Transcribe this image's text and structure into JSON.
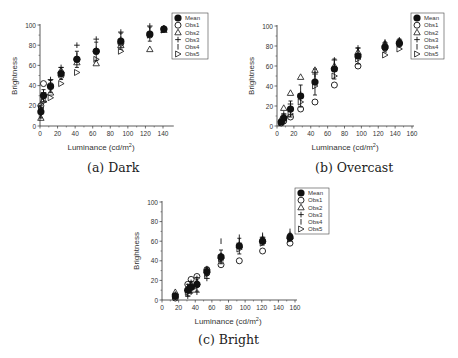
{
  "chart_data": [
    {
      "id": "dark",
      "type": "scatter",
      "caption": "(a) Dark",
      "title": "",
      "xlabel": "Luminance (cd/m²)",
      "ylabel": "Brightness",
      "xlim": [
        0,
        150
      ],
      "ylim": [
        0,
        100
      ],
      "xticks": [
        0,
        20,
        40,
        60,
        80,
        100,
        120,
        140
      ],
      "yticks": [
        0,
        20,
        40,
        60,
        80,
        100
      ],
      "grid": false,
      "legend_position": "upper right (outside)",
      "legend": [
        "Mean",
        "Obs1",
        "Obs2",
        "Obs3",
        "Obs4",
        "Obs5"
      ],
      "x": [
        1,
        4,
        12,
        24,
        42,
        64,
        92,
        125,
        141
      ],
      "series": [
        {
          "name": "Mean",
          "marker": "filled-circle",
          "values": [
            14,
            30,
            39,
            52,
            66,
            74,
            84,
            91,
            96
          ],
          "err": [
            6,
            6,
            6,
            6,
            8,
            9,
            8,
            7,
            2
          ]
        },
        {
          "name": "Obs1",
          "marker": "open-circle",
          "values": [
            20,
            42,
            40,
            50,
            66,
            74,
            82,
            90,
            96
          ]
        },
        {
          "name": "Obs2",
          "marker": "open-triangle",
          "values": [
            8,
            26,
            33,
            55,
            63,
            62,
            80,
            76,
            95
          ]
        },
        {
          "name": "Obs3",
          "marker": "plus",
          "values": [
            18,
            33,
            46,
            58,
            80,
            86,
            93,
            99,
            97
          ]
        },
        {
          "name": "Obs4",
          "marker": "vbar",
          "values": [
            10,
            28,
            44,
            53,
            70,
            76,
            86,
            95,
            97
          ]
        },
        {
          "name": "Obs5",
          "marker": "right-triangle",
          "values": [
            17,
            24,
            28,
            42,
            53,
            66,
            74,
            90,
            95
          ]
        }
      ]
    },
    {
      "id": "overcast",
      "type": "scatter",
      "caption": "(b) Overcast",
      "title": "",
      "xlabel": "Luminance (cd/m²)",
      "ylabel": "Brightness",
      "xlim": [
        0,
        160
      ],
      "ylim": [
        0,
        100
      ],
      "xticks": [
        0,
        20,
        40,
        60,
        80,
        100,
        120,
        140,
        160
      ],
      "yticks": [
        0,
        20,
        40,
        60,
        80,
        100
      ],
      "grid": false,
      "legend_position": "upper right (outside)",
      "legend": [
        "Mean",
        "Obs1",
        "Obs2",
        "Obs3",
        "Obs4",
        "Obs5"
      ],
      "x": [
        5,
        8,
        16,
        28,
        45,
        68,
        96,
        128,
        145
      ],
      "series": [
        {
          "name": "Mean",
          "marker": "filled-circle",
          "values": [
            4,
            8,
            17,
            30,
            44,
            57,
            70,
            79,
            83
          ],
          "err": [
            2,
            4,
            8,
            11,
            13,
            10,
            8,
            5,
            4
          ]
        },
        {
          "name": "Obs1",
          "marker": "open-circle",
          "values": [
            3,
            5,
            9,
            17,
            24,
            41,
            60,
            78,
            82
          ]
        },
        {
          "name": "Obs2",
          "marker": "open-triangle",
          "values": [
            7,
            18,
            33,
            49,
            56,
            60,
            74,
            82,
            85
          ]
        },
        {
          "name": "Obs3",
          "marker": "plus",
          "values": [
            5,
            12,
            22,
            32,
            52,
            66,
            78,
            83,
            86
          ]
        },
        {
          "name": "Obs4",
          "marker": "vbar",
          "values": [
            4,
            10,
            20,
            28,
            48,
            62,
            76,
            84,
            84
          ]
        },
        {
          "name": "Obs5",
          "marker": "right-triangle",
          "values": [
            3,
            6,
            12,
            24,
            40,
            50,
            67,
            71,
            77
          ]
        }
      ]
    },
    {
      "id": "bright",
      "type": "scatter",
      "caption": "(c) Bright",
      "title": "",
      "xlabel": "Luminance (cd/m²)",
      "ylabel": "Brightness",
      "xlim": [
        0,
        160
      ],
      "ylim": [
        0,
        100
      ],
      "xticks": [
        0,
        20,
        40,
        60,
        80,
        100,
        120,
        140,
        160
      ],
      "yticks": [
        0,
        20,
        40,
        60,
        80,
        100
      ],
      "grid": false,
      "legend_position": "upper right (outside)",
      "legend": [
        "Mean",
        "Obs1",
        "Obs2",
        "Obs3",
        "Obs4",
        "Obs5"
      ],
      "x": [
        16,
        31,
        35,
        42,
        54,
        71,
        93,
        121,
        154
      ],
      "series": [
        {
          "name": "Mean",
          "marker": "filled-circle",
          "values": [
            4,
            10,
            13,
            16,
            29,
            44,
            55,
            60,
            64
          ],
          "err": [
            3,
            6,
            6,
            7,
            4,
            7,
            8,
            4,
            4
          ]
        },
        {
          "name": "Obs1",
          "marker": "open-circle",
          "values": [
            2,
            16,
            21,
            24,
            31,
            36,
            40,
            50,
            58
          ]
        },
        {
          "name": "Obs2",
          "marker": "open-triangle",
          "values": [
            8,
            12,
            16,
            18,
            30,
            45,
            56,
            62,
            65
          ]
        },
        {
          "name": "Obs3",
          "marker": "plus",
          "values": [
            3,
            4,
            8,
            8,
            22,
            40,
            58,
            64,
            67
          ]
        },
        {
          "name": "Obs4",
          "marker": "vbar",
          "values": [
            6,
            14,
            18,
            22,
            32,
            60,
            64,
            66,
            70
          ]
        },
        {
          "name": "Obs5",
          "marker": "right-triangle",
          "values": [
            4,
            8,
            12,
            14,
            26,
            42,
            52,
            58,
            62
          ]
        }
      ]
    }
  ]
}
